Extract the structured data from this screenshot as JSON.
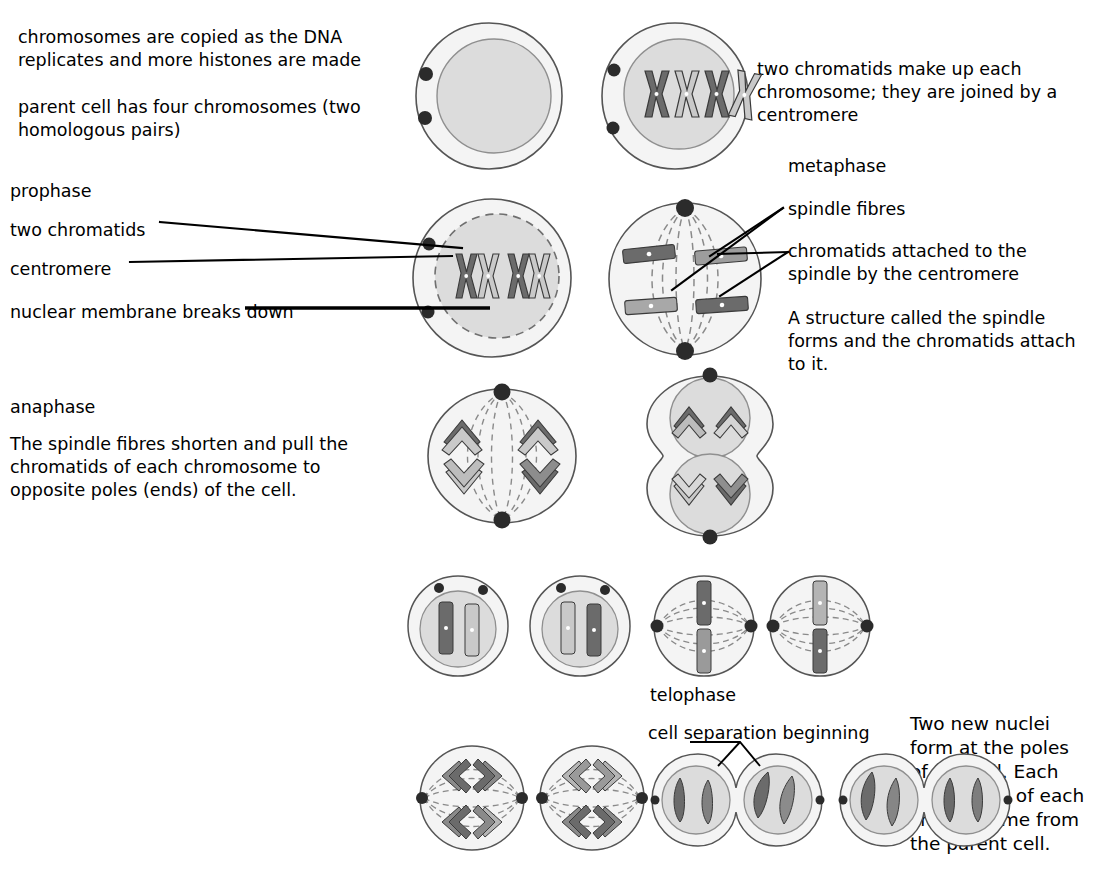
{
  "figure": {
    "colors": {
      "cytoplasm": "#f4f4f4",
      "nucleus": "#dcdcdc",
      "nucleus_edge": "#8f8f8f",
      "membrane_edge": "#555555",
      "chromosome_dark": "#6b6b6b",
      "chromosome_light": "#c9c9c9",
      "chromosome_edge": "#3a3a3a",
      "centriole": "#2b2b2b",
      "spindle": "#8a8a8a",
      "leader": "#000000"
    }
  },
  "labels": {
    "interphase_copy": "chromosomes are copied as the DNA\nreplicates and more histones are made",
    "parent_cell": "parent cell has four chromosomes (two\nhomologous pairs)",
    "two_chromatids_note": "two chromatids make up each\nchromosome; they are joined by a\ncentromere",
    "prophase": "prophase",
    "two_chromatids": "two chromatids",
    "centromere": "centromere",
    "nuclear_membrane": "nuclear membrane breaks down",
    "metaphase": "metaphase",
    "spindle_fibres": "spindle fibres",
    "chromatids_attached": "chromatids attached to the\nspindle by the centromere",
    "spindle_structure": "A structure called the spindle\nforms and the chromatids attach\nto it.",
    "anaphase": "anaphase",
    "anaphase_body": "The spindle fibres shorten and pull the\nchromatids of each chromosome to\nopposite poles (ends) of the cell.",
    "telophase": "telophase",
    "cell_separation": "cell separation beginning",
    "two_new_nuclei": "Two new nuclei\nform at the poles\nof the cell. Each\nhas a copy of each\nchromosome from\nthe parent cell."
  },
  "cells": {
    "interphase_plain": {
      "name": "interphase cell, plain nucleus",
      "stage": "interphase",
      "chromosome_count": 0,
      "centrioles": 2,
      "nuclear_membrane": "intact",
      "spindle": false
    },
    "interphase_replicated": {
      "name": "cell with four replicated chromosomes",
      "stage": "interphase / late S",
      "chromosome_count": 4,
      "chromosome_shades": [
        "dark",
        "light",
        "dark",
        "light"
      ],
      "centrioles": 2,
      "nuclear_membrane": "intact",
      "spindle": false
    },
    "prophase": {
      "name": "prophase cell",
      "stage": "prophase",
      "chromosome_count": 4,
      "chromosome_shades": [
        "dark",
        "light",
        "dark",
        "light"
      ],
      "centrioles": 2,
      "nuclear_membrane": "dashed / breaking down",
      "spindle": false
    },
    "metaphase": {
      "name": "metaphase cell",
      "stage": "metaphase",
      "chromosome_count": 4,
      "chromosome_shades": [
        "dark",
        "light",
        "light",
        "dark"
      ],
      "centrioles": 2,
      "pole_axis": "vertical",
      "nuclear_membrane": "absent",
      "spindle": true
    },
    "anaphase": {
      "name": "anaphase cell",
      "stage": "anaphase",
      "chromatid_groups": 4,
      "centrioles": 2,
      "pole_axis": "vertical",
      "nuclear_membrane": "absent",
      "spindle": true
    },
    "early_telophase": {
      "name": "dumbbell cell with two reforming nuclei",
      "stage": "late anaphase / early telophase",
      "nuclei": 2,
      "chromatid_groups_per_nucleus": 2,
      "centrioles": 2,
      "nuclear_membrane": "reforming"
    },
    "daughter_pair_nuclei": {
      "name": "pair of daughter cells with nuclei",
      "count": 2,
      "chromosomes_each": 2,
      "centrioles_each": 2,
      "nuclear_membrane": "intact"
    },
    "daughter_pair_spindle": {
      "name": "pair of cells with horizontal spindle",
      "count": 2,
      "chromosomes_each": 2,
      "centrioles_each": 2,
      "pole_axis": "horizontal",
      "spindle": true
    },
    "anaphase_pair": {
      "name": "pair of cells in anaphase with horizontal spindle",
      "count": 2,
      "chromatid_groups_each": 4,
      "centrioles_each": 2,
      "pole_axis": "horizontal",
      "spindle": true
    },
    "telophase_pair_left": {
      "name": "dividing cell with separation furrow, labelled",
      "lobes": 2,
      "chromosomes_per_lobe": 2,
      "centrioles": 2
    },
    "telophase_pair_right": {
      "name": "dividing cell with separation furrow",
      "lobes": 2,
      "chromosomes_per_lobe": 2,
      "centrioles": 2
    }
  }
}
